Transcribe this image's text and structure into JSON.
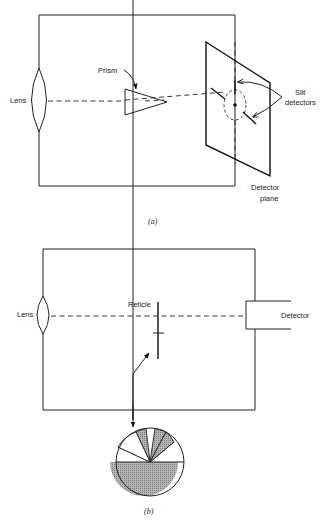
{
  "figure_a": {
    "caption": "(a)",
    "labels": {
      "lens": "Lens",
      "prism": "Prism",
      "slit_detectors_line1": "Slit",
      "slit_detectors_line2": "detectors",
      "detector_plane_line1": "Detector",
      "detector_plane_line2": "plane"
    }
  },
  "figure_b": {
    "caption": "(b)",
    "labels": {
      "lens": "Lens",
      "reticle": "Reticle",
      "detector": "Detector"
    },
    "reticle_pattern": {
      "lower_half": "hatched",
      "upper_sectors": [
        "hatched",
        "clear",
        "hatched",
        "clear"
      ]
    }
  },
  "colors": {
    "line": "#222222",
    "hatch": "#9a9a9a",
    "background": "#ffffff"
  }
}
